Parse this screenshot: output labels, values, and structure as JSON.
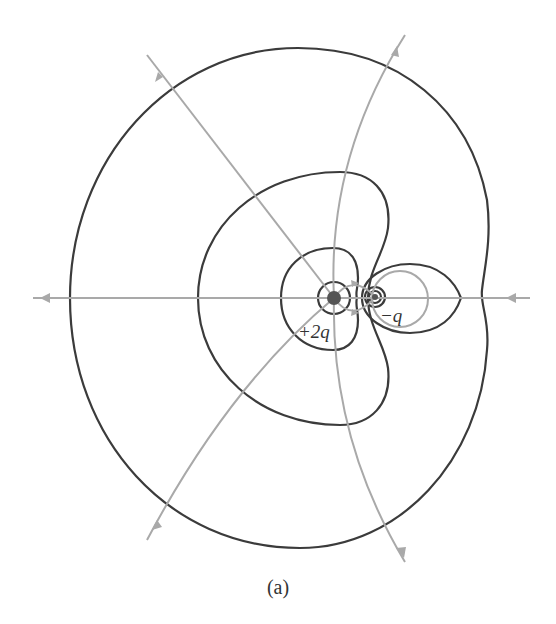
{
  "figure": {
    "caption": "(a)",
    "charges": [
      {
        "label": "+2q",
        "sign": "positive",
        "x": 334,
        "y": 298
      },
      {
        "label": "−q",
        "sign": "negative",
        "x": 375,
        "y": 297
      }
    ],
    "colors": {
      "equipotential": "#3b3b3b",
      "field_line": "#a9a9a9",
      "charge_fill": "#555555",
      "background": "#ffffff"
    },
    "legend": {
      "equipotential_lines": "dark curves",
      "field_lines": "gray curves with arrows"
    }
  }
}
